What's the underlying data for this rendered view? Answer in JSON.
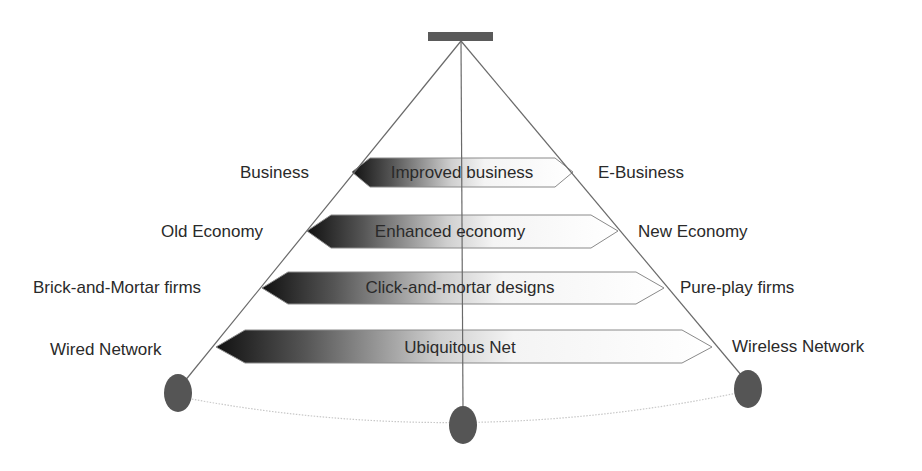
{
  "diagram": {
    "type": "pyramid-transition",
    "colors": {
      "line": "#6a6a6a",
      "node_fill": "#555555",
      "bar_fill": "#5a5a5a",
      "arrow_dark": "#1a1a1a",
      "arrow_light": "#ffffff",
      "arc": "#c8c8c8",
      "text": "#2a2a2a"
    },
    "rows": [
      {
        "left": "Business",
        "arrow": "Improved business",
        "right": "E-Business"
      },
      {
        "left": "Old Economy",
        "arrow": "Enhanced economy",
        "right": "New Economy"
      },
      {
        "left": "Brick-and-Mortar firms",
        "arrow": "Click-and-mortar designs",
        "right": "Pure-play firms"
      },
      {
        "left": "Wired Network",
        "arrow": "Ubiquitous Net",
        "right": "Wireless Network"
      }
    ],
    "nodes": [
      "left-node",
      "center-node",
      "right-node"
    ]
  }
}
